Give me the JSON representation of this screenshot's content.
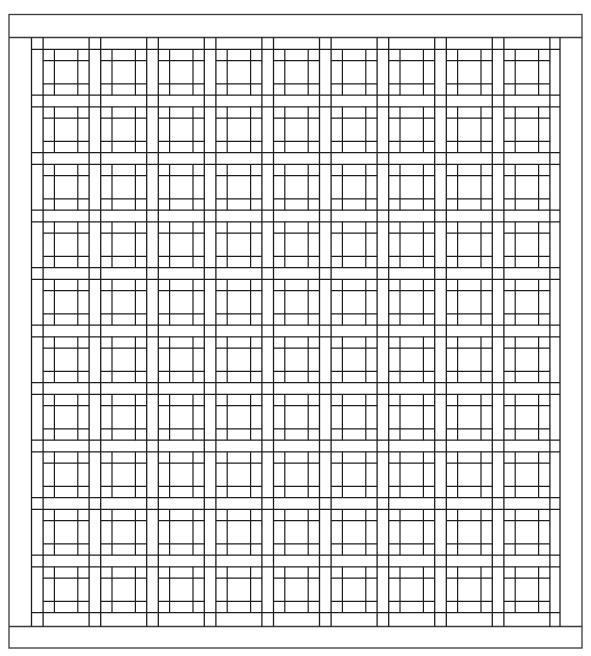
{
  "drawing": {
    "width": 591,
    "height": 656,
    "background": "#ffffff",
    "line_color": "#1e1e1e",
    "frame": {
      "left": 9,
      "top": 14.5,
      "right": 582,
      "bottom": 648
    },
    "header_band": {
      "bottom": 37.5
    },
    "footer_band": {
      "top": 626.5
    },
    "lattice": {
      "columns": 9,
      "rows": 10,
      "x_start": 31.5,
      "y_start": 49.3,
      "pitch_x": 57.6,
      "pitch_y": 57.5,
      "sash_width": 11.6,
      "block_inset": 11.3,
      "left_edge": 31.5,
      "right_edge": 560,
      "top_edge": 37.5,
      "bottom_edge": 626.5
    },
    "block_pattern": "3x3 nine-patch grid inside each lattice square"
  }
}
